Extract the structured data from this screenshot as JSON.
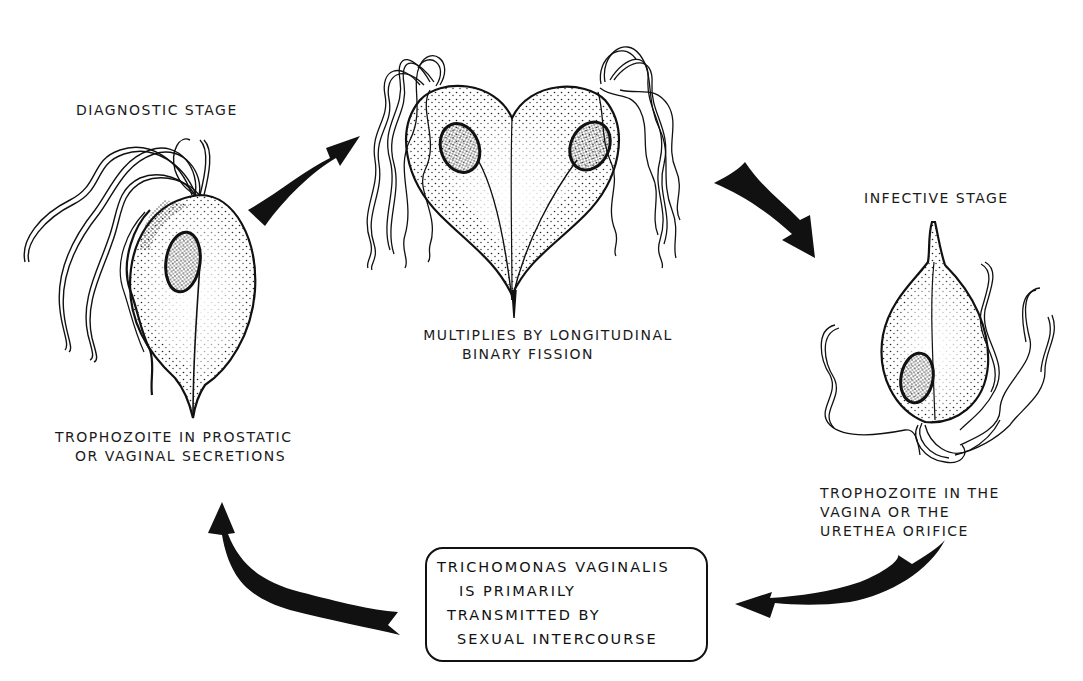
{
  "diagram": {
    "stages": [
      {
        "id": "diagnostic",
        "title": "DIAGNOSTIC STAGE",
        "caption_lines": [
          "TROPHOZOITE IN PROSTATIC",
          "OR VAGINAL SECRETIONS"
        ]
      },
      {
        "id": "division",
        "title": "",
        "caption_lines": [
          "MULTIPLIES BY LONGITUDINAL",
          "BINARY FISSION"
        ]
      },
      {
        "id": "infective",
        "title": "INFECTIVE STAGE",
        "caption_lines": [
          "TROPHOZOITE IN THE",
          "VAGINA OR THE",
          "URETHEA ORIFICE"
        ]
      }
    ],
    "info_box": {
      "lines": [
        "TRICHOMONAS VAGINALIS",
        "IS PRIMARILY",
        "TRANSMITTED BY",
        "SEXUAL INTERCOURSE"
      ]
    },
    "arrows": [
      {
        "from": "diagnostic",
        "to": "division",
        "direction": "up-right"
      },
      {
        "from": "division",
        "to": "infective",
        "direction": "down-right"
      },
      {
        "from": "infective",
        "to": "info_box",
        "direction": "down-left"
      },
      {
        "from": "info_box",
        "to": "diagnostic",
        "direction": "up-left"
      }
    ],
    "colors": {
      "ink": "#111111",
      "paper": "#ffffff"
    }
  }
}
